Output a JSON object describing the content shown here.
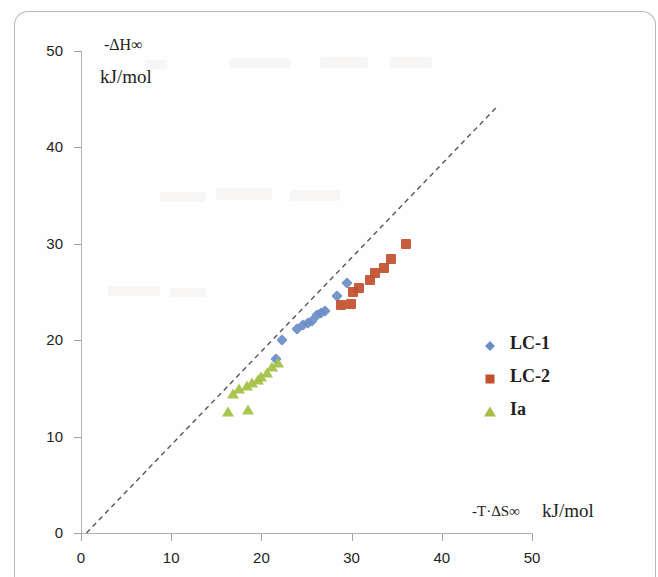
{
  "chart_data": {
    "type": "scatter",
    "title": "",
    "xlabel": "-T·ΔS∞",
    "xlabel_unit": "kJ/mol",
    "ylabel": "-ΔH∞",
    "ylabel_unit": "kJ/mol",
    "xlim": [
      0,
      50
    ],
    "ylim": [
      0,
      50
    ],
    "xticks": [
      0,
      10,
      20,
      30,
      40,
      50
    ],
    "yticks": [
      0,
      10,
      20,
      30,
      40,
      50
    ],
    "xtick_labels": [
      "0",
      "10",
      "20",
      "30",
      "40",
      "50"
    ],
    "ytick_labels": [
      "0",
      "10",
      "20",
      "30",
      "40",
      "50"
    ],
    "grid": false,
    "legend_position": "center-right",
    "series": [
      {
        "name": "LC-1",
        "marker": "diamond",
        "color": "#6b8dc7",
        "points": [
          [
            21.6,
            18.0
          ],
          [
            22.3,
            20.0
          ],
          [
            24.0,
            21.2
          ],
          [
            24.6,
            21.6
          ],
          [
            25.2,
            21.8
          ],
          [
            25.6,
            22.0
          ],
          [
            26.2,
            22.6
          ],
          [
            26.6,
            22.8
          ],
          [
            27.0,
            23.0
          ],
          [
            28.4,
            24.6
          ],
          [
            29.5,
            25.9
          ]
        ]
      },
      {
        "name": "LC-2",
        "marker": "square",
        "color": "#c1502e",
        "points": [
          [
            28.8,
            23.6
          ],
          [
            29.9,
            23.8
          ],
          [
            30.2,
            25.0
          ],
          [
            30.8,
            25.4
          ],
          [
            32.0,
            26.2
          ],
          [
            32.6,
            27.0
          ],
          [
            33.6,
            27.5
          ],
          [
            34.4,
            28.4
          ],
          [
            36.0,
            30.0
          ]
        ]
      },
      {
        "name": "Ia",
        "marker": "triangle",
        "color": "#a3c042",
        "points": [
          [
            16.3,
            12.6
          ],
          [
            18.5,
            12.8
          ],
          [
            16.9,
            14.4
          ],
          [
            17.5,
            14.9
          ],
          [
            18.4,
            15.3
          ],
          [
            19.0,
            15.6
          ],
          [
            19.6,
            15.9
          ],
          [
            20.0,
            16.2
          ],
          [
            20.6,
            16.6
          ],
          [
            21.2,
            17.2
          ],
          [
            21.8,
            17.6
          ]
        ]
      }
    ],
    "trendline": {
      "style": "dashed",
      "color": "#55565a",
      "x_start": 0.6,
      "y_start": 0.0,
      "x_end": 46.0,
      "y_end": 44.1
    }
  },
  "legend": {
    "items": [
      {
        "label": "LC-1",
        "marker": "diamond-marker",
        "color": "#6b8dc7"
      },
      {
        "label": "LC-2",
        "marker": "square-marker",
        "color": "#c1502e"
      },
      {
        "label": "Ia",
        "marker": "triangle-marker",
        "color": "#a3c042"
      }
    ]
  }
}
